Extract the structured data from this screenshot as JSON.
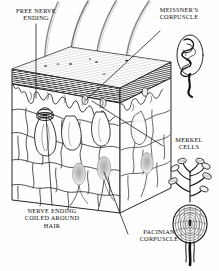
{
  "figure": {
    "style": "black-and-white pen-and-ink anatomical line illustration",
    "background_color": "#ffffff",
    "ink_color": "#111111"
  },
  "labels": [
    {
      "id": "free-nerve-ending",
      "text": "FREE NERVE\nENDING",
      "position": "top-left",
      "leader": "vertical line down into epidermis"
    },
    {
      "id": "meissners-corpuscle",
      "text": "MEISSNER'S\nCORPUSCLE",
      "position": "top-right",
      "leader": "diagonal line down-left to dermal papilla"
    },
    {
      "id": "merkel-cells",
      "text": "MERKEL\nCELLS",
      "position": "right",
      "leader": "horizontal line left into epidermal basal layer"
    },
    {
      "id": "nerve-ending-coiled-around-hair",
      "text": "NERVE ENDING\nCOILED AROUND\nHAIR",
      "position": "bottom-left",
      "leader": "vertical line up to hair follicle bulb"
    },
    {
      "id": "pacinian-corpuscle",
      "text": "PACINIAN\nCORPUSCLE",
      "position": "bottom-right",
      "leader": "diagonal line up-left to deep dermal receptor"
    }
  ],
  "insets": [
    {
      "id": "meissners-corpuscle-inset",
      "name": "Meissner's corpuscle detail",
      "description": "tightly coiled convoluted nerve ending within an oval capsule, with a thick nerve fiber trailing below",
      "anchor": "top-right"
    },
    {
      "id": "merkel-cells-inset",
      "name": "Merkel cells detail",
      "description": "branching nerve terminal with seven flattened disc-shaped Merkel cells at the branch tips",
      "anchor": "right"
    },
    {
      "id": "pacinian-corpuscle-inset",
      "name": "Pacinian corpuscle detail",
      "description": "onion-like ovoid of concentric lamellae around a central core with a stalk of nerve fibers below",
      "anchor": "bottom-right"
    }
  ],
  "block": {
    "name": "skin block",
    "shape": "three-dimensional rectangular wedge drawn in oblique perspective",
    "layers": [
      {
        "id": "epidermis",
        "name": "epidermis",
        "rendering": "dense horizontal hatching band across the top and right cut faces"
      },
      {
        "id": "dermis",
        "name": "dermis",
        "rendering": "open network of irregular polygonal collagen fiber bundles"
      }
    ],
    "features": [
      {
        "id": "hair-shafts",
        "name": "hair shafts",
        "count": 4,
        "description": "long curved hairs rising from the skin surface"
      },
      {
        "id": "dermal-papillae",
        "name": "dermal papillae",
        "description": "wavy epidermal-dermal junction with finger-like upward projections"
      },
      {
        "id": "hair-follicles",
        "name": "hair follicles",
        "count": 3,
        "description": "bulb-shaped follicles in the dermis, one encircled by a coiled nerve ending"
      },
      {
        "id": "pacinian-corpuscles-in-dermis",
        "name": "Pacinian corpuscles",
        "count": 3,
        "description": "shaded ovoid bodies deep in the dermis"
      }
    ]
  }
}
